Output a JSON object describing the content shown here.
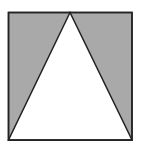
{
  "diagram": {
    "square": {
      "x": 8.5,
      "y": 12.5,
      "width": 123.5,
      "height": 127.5
    },
    "triangle": {
      "apex": [
        70,
        12.5
      ],
      "base_left": [
        8.5,
        140
      ],
      "base_right": [
        132,
        140
      ]
    },
    "colors": {
      "shade": "#a9a9a9",
      "stroke": "#222222",
      "fill": "#ffffff"
    }
  }
}
